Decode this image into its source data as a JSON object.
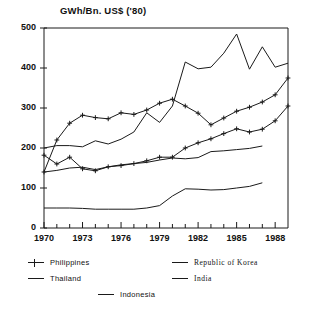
{
  "chart_data": {
    "type": "line",
    "title": "GWh/Bn. US$ ('80)",
    "xlabel": "",
    "ylabel": "GWh/Bn. US$ ('80)",
    "xlim": [
      1970,
      1989
    ],
    "ylim": [
      0,
      500
    ],
    "grid": false,
    "legend_position": "below",
    "y_ticks": [
      0,
      100,
      200,
      300,
      400,
      500
    ],
    "y_tick_labels": [
      "0",
      "100",
      "200",
      "300",
      "400",
      "500"
    ],
    "x_ticks": [
      1970,
      1971,
      1972,
      1973,
      1974,
      1975,
      1976,
      1977,
      1978,
      1979,
      1980,
      1981,
      1982,
      1983,
      1984,
      1985,
      1986,
      1987,
      1988
    ],
    "x_tick_labels": [
      "1970",
      "1973",
      "1976",
      "1979",
      "1982",
      "1985",
      "1988"
    ],
    "x_labeled_ticks": [
      1970,
      1973,
      1976,
      1979,
      1982,
      1985,
      1988
    ],
    "x": [
      1970,
      1971,
      1972,
      1973,
      1974,
      1975,
      1976,
      1977,
      1978,
      1979,
      1980,
      1981,
      1982,
      1983,
      1984,
      1985,
      1986,
      1987,
      1988,
      1989
    ],
    "series": [
      {
        "name": "Philippines",
        "marker": "plus",
        "values": [
          140,
          220,
          262,
          282,
          276,
          273,
          288,
          284,
          295,
          312,
          322,
          305,
          287,
          258,
          275,
          292,
          302,
          315,
          333,
          375
        ]
      },
      {
        "name": "Thailand",
        "marker": "none",
        "values": [
          140,
          144,
          150,
          152,
          146,
          153,
          158,
          161,
          164,
          170,
          175,
          173,
          176,
          191,
          193,
          196,
          199,
          205,
          null,
          null
        ]
      },
      {
        "name": "Republic of Korea",
        "marker": "none",
        "values": [
          200,
          206,
          206,
          203,
          218,
          210,
          222,
          240,
          288,
          264,
          305,
          415,
          398,
          402,
          437,
          485,
          397,
          453,
          402,
          412
        ]
      },
      {
        "name": "India",
        "marker": "plus",
        "values": [
          182,
          160,
          177,
          148,
          143,
          153,
          156,
          161,
          168,
          177,
          177,
          200,
          213,
          223,
          236,
          248,
          240,
          247,
          268,
          305
        ]
      },
      {
        "name": "Indonesia",
        "marker": "none",
        "values": [
          50,
          50,
          50,
          49,
          47,
          47,
          47,
          47,
          50,
          56,
          80,
          98,
          97,
          95,
          96,
          100,
          104,
          113,
          null,
          null
        ]
      }
    ]
  },
  "legend": {
    "entries": [
      {
        "label": "Philippines",
        "marker": "plus",
        "column": "left",
        "row": 0
      },
      {
        "label": "Republic of Korea",
        "marker": "none",
        "column": "right",
        "row": 0
      },
      {
        "label": "Thailand",
        "marker": "none",
        "column": "left",
        "row": 1
      },
      {
        "label": "India",
        "marker": "none",
        "column": "right",
        "row": 1
      },
      {
        "label": "Indonesia",
        "marker": "none",
        "column": "center",
        "row": 2
      }
    ]
  }
}
